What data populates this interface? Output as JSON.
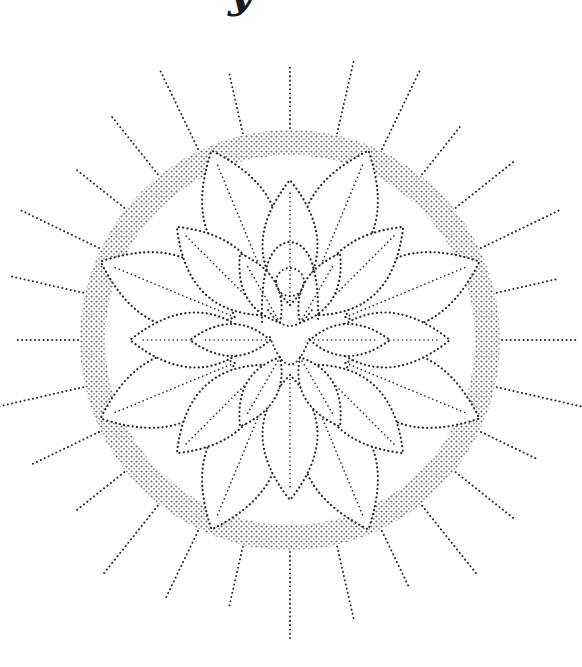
{
  "image": {
    "subject": "stippled lotus mandala with central figure",
    "style": "dot / stipple line art",
    "colors": {
      "background": "#ffffff",
      "ink": "#2b2b2b",
      "ring_shade": "#555555"
    }
  },
  "header_fragment": {
    "text": "y"
  },
  "corner_mark": {
    "text": ""
  },
  "mandala": {
    "center": [
      290,
      340
    ],
    "ring_outer_radius": 210,
    "ring_inner_radius": 185,
    "ray_count": 28,
    "ray_length": 80,
    "outer_petals": 8,
    "inner_petals": 8,
    "core_petals": 6,
    "figure": {
      "head_center": [
        290,
        282
      ],
      "head_radius": 14
    }
  }
}
